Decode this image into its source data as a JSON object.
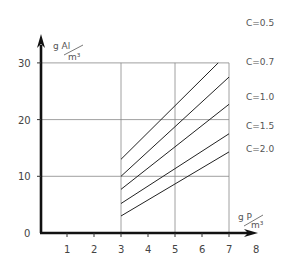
{
  "chart_data": {
    "type": "line",
    "title": "",
    "xlabel": "g P / m³",
    "ylabel": "g Al / m³",
    "xlim": [
      0,
      8
    ],
    "ylim": [
      0,
      33
    ],
    "x_ticks": [
      1,
      2,
      3,
      4,
      5,
      6,
      7,
      8
    ],
    "y_ticks": [
      0,
      10,
      20,
      30
    ],
    "grid": {
      "horizontal_at": [
        10,
        20,
        30
      ],
      "vertical_at": [
        3,
        5,
        7
      ],
      "region": "x from 3 to 7"
    },
    "legend_position": "right, labels at line ends",
    "series": [
      {
        "name": "C=0.5",
        "x": [
          3,
          6.6
        ],
        "y": [
          13,
          30
        ]
      },
      {
        "name": "C=0.7",
        "x": [
          3,
          7
        ],
        "y": [
          10,
          27.5
        ]
      },
      {
        "name": "C=1.0",
        "x": [
          3,
          7
        ],
        "y": [
          7.7,
          22.7
        ]
      },
      {
        "name": "C=1.5",
        "x": [
          3,
          7
        ],
        "y": [
          5.2,
          17.5
        ]
      },
      {
        "name": "C=2.0",
        "x": [
          3,
          7
        ],
        "y": [
          3,
          14.3
        ]
      }
    ]
  },
  "axes": {
    "origin_label": "0",
    "y_unit_top": "g  Al",
    "y_unit_bottom": "m³",
    "x_unit_top": "g  P",
    "x_unit_bottom": "m³"
  },
  "legend": [
    {
      "label": "C=0.5"
    },
    {
      "label": "C=0.7"
    },
    {
      "label": "C=1.0"
    },
    {
      "label": "C=1.5"
    },
    {
      "label": "C=2.0"
    }
  ]
}
